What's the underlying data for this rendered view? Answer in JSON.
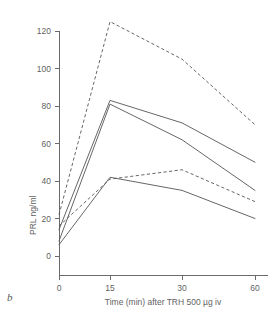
{
  "figure": {
    "panel_letter": "b"
  },
  "chart_data": {
    "type": "line",
    "title": "",
    "subtitle": "",
    "xlabel": "Time (min) after TRH 500 µg iv",
    "ylabel": "PRL ng/ml",
    "x": [
      0,
      15,
      30,
      60
    ],
    "xtick_labels": [
      "0",
      "15",
      "30",
      "60"
    ],
    "ytick_labels": [
      "0",
      "20",
      "40",
      "60",
      "80",
      "100",
      "120"
    ],
    "yticks": [
      0,
      20,
      40,
      60,
      80,
      100,
      120
    ],
    "xlim": [
      0,
      60
    ],
    "ylim": [
      0,
      125
    ],
    "grid": false,
    "legend": "none",
    "axis_style": "left-and-bottom-spines",
    "series": [
      {
        "name": "series-1-dashed-upper",
        "style": "dashed",
        "values": [
          22,
          125,
          105,
          70
        ]
      },
      {
        "name": "series-2-solid-upper",
        "style": "solid",
        "values": [
          14,
          83,
          71,
          50
        ]
      },
      {
        "name": "series-3-solid-second",
        "style": "solid",
        "values": [
          8,
          81,
          62,
          35
        ]
      },
      {
        "name": "series-4-dashed-lower",
        "style": "dashed",
        "values": [
          16,
          41,
          46,
          29
        ]
      },
      {
        "name": "series-5-solid-lower",
        "style": "solid",
        "values": [
          6,
          42,
          35,
          20
        ]
      }
    ]
  }
}
